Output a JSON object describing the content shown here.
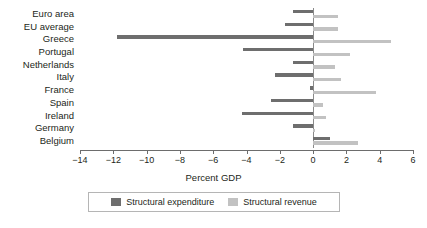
{
  "chart_data": {
    "type": "bar",
    "orientation": "horizontal",
    "title": "",
    "xlabel": "Percent GDP",
    "ylabel": "",
    "xlim": [
      -14,
      6
    ],
    "xticks": [
      -14,
      -12,
      -10,
      -8,
      -6,
      -4,
      -2,
      0,
      2,
      4,
      6
    ],
    "xticklabels": [
      "−14",
      "−12",
      "−10",
      "−8",
      "−6",
      "−4",
      "−2",
      "0",
      "2",
      "4",
      "6"
    ],
    "grid": false,
    "legend_position": "bottom",
    "categories": [
      "Euro area",
      "EU average",
      "Greece",
      "Portugal",
      "Netherlands",
      "Italy",
      "France",
      "Spain",
      "Ireland",
      "Germany",
      "Belgium"
    ],
    "series": [
      {
        "name": "Structural expenditure",
        "color": "#6e6e6e",
        "values": [
          -1.2,
          -1.7,
          -11.8,
          -4.2,
          -1.2,
          -2.3,
          -0.2,
          -2.5,
          -4.3,
          -1.2,
          1.0
        ]
      },
      {
        "name": "Structural revenue",
        "color": "#c2c2c2",
        "values": [
          1.5,
          1.5,
          4.7,
          2.2,
          1.3,
          1.7,
          3.8,
          0.6,
          0.8,
          0.1,
          2.7
        ]
      }
    ]
  },
  "legend": {
    "items": [
      {
        "label": "Structural expenditure",
        "swatch": "exp"
      },
      {
        "label": "Structural revenue",
        "swatch": "rev"
      }
    ]
  }
}
